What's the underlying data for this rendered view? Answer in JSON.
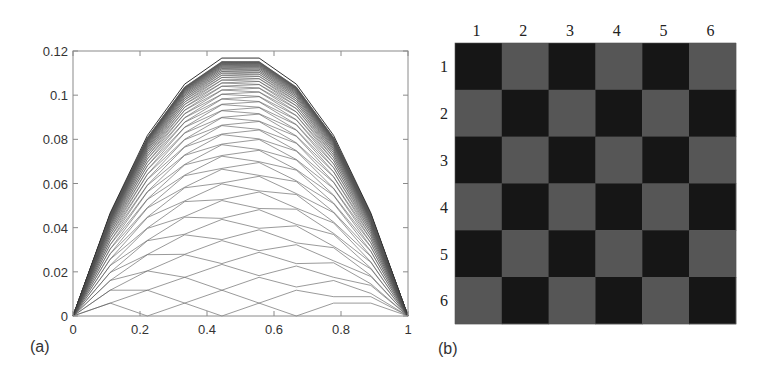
{
  "chart_data": [
    {
      "panel": "(a)",
      "type": "line",
      "title": "",
      "xlabel": "",
      "ylabel": "",
      "xlim": [
        0,
        1
      ],
      "ylim": [
        0,
        0.12
      ],
      "grid": false,
      "legend": null,
      "xticks": [
        0,
        0.2,
        0.4,
        0.6,
        0.8,
        1
      ],
      "xtick_labels": [
        "0",
        "0.2",
        "0.4",
        "0.6",
        "0.8",
        "1"
      ],
      "yticks": [
        0,
        0.02,
        0.04,
        0.06,
        0.08,
        0.1,
        0.12
      ],
      "ytick_labels": [
        "0",
        "0.02",
        "0.04",
        "0.06",
        "0.08",
        "0.1",
        "0.12"
      ],
      "x": [
        0,
        0.1111,
        0.2222,
        0.3333,
        0.4444,
        0.5556,
        0.6667,
        0.7778,
        0.8889,
        1
      ],
      "envelope": [
        0,
        0.0467,
        0.0818,
        0.105,
        0.1168,
        0.1168,
        0.105,
        0.0818,
        0.0467,
        0
      ],
      "family": {
        "description": "Family of piecewise-linear iterates converging to the envelope (alternating odd/even lattice pattern)",
        "source_step": 0.00584,
        "initial": [
          0,
          0.00584,
          0,
          0.00584,
          0,
          0.00584,
          0,
          0.00584,
          0.00584,
          0
        ],
        "num_curves": 70
      },
      "line_color": "#555555"
    },
    {
      "panel": "(b)",
      "type": "heatmap",
      "title": "",
      "col_labels": [
        "1",
        "2",
        "3",
        "4",
        "5",
        "6"
      ],
      "row_labels": [
        "1",
        "2",
        "3",
        "4",
        "5",
        "6"
      ],
      "values": [
        [
          1,
          0,
          1,
          0,
          1,
          0
        ],
        [
          0,
          1,
          0,
          1,
          0,
          1
        ],
        [
          1,
          0,
          1,
          0,
          1,
          0
        ],
        [
          0,
          1,
          0,
          1,
          0,
          1
        ],
        [
          1,
          0,
          1,
          0,
          1,
          0
        ],
        [
          0,
          1,
          0,
          1,
          0,
          1
        ]
      ],
      "colors": {
        "1": "#161616",
        "0": "#565656"
      }
    }
  ],
  "labels": {
    "panel_a": "(a)",
    "panel_b": "(b)"
  }
}
